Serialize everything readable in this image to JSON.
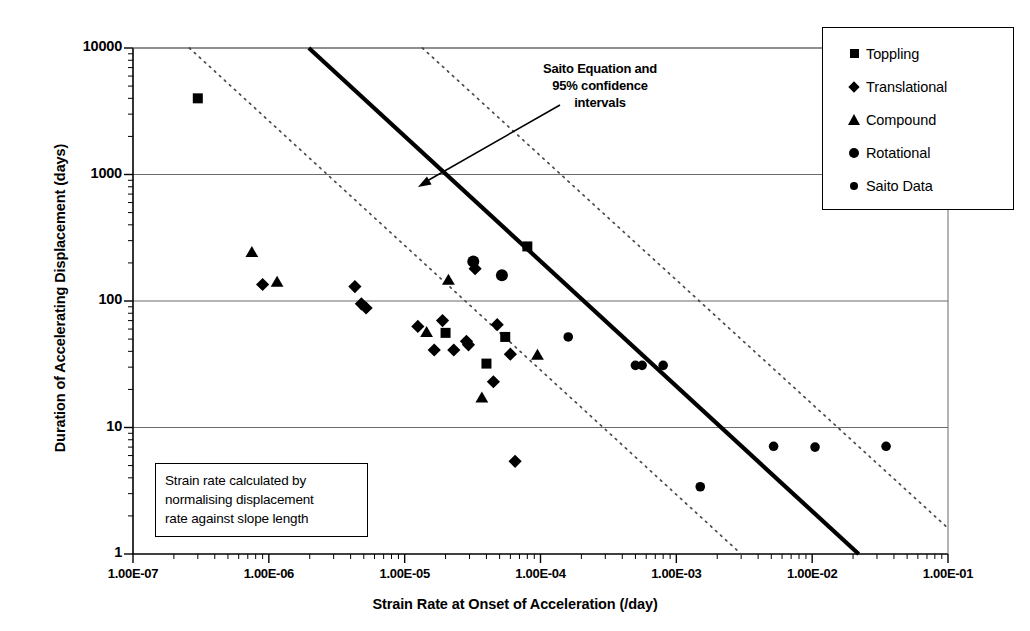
{
  "chart_data": {
    "type": "scatter",
    "title": "",
    "xlabel": "Strain Rate at Onset of Acceleration (/day)",
    "ylabel": "Duration of Accelerating Displacement (days)",
    "xscale": "log",
    "yscale": "log",
    "xlim": [
      1e-07,
      0.1
    ],
    "ylim": [
      1,
      10000
    ],
    "xticklabels": [
      "1.00E-07",
      "1.00E-06",
      "1.00E-05",
      "1.00E-04",
      "1.00E-03",
      "1.00E-02",
      "1.00E-01"
    ],
    "xtickvalues": [
      1e-07,
      1e-06,
      1e-05,
      0.0001,
      0.001,
      0.01,
      0.1
    ],
    "yticklabels": [
      "1",
      "10",
      "100",
      "1000",
      "10000"
    ],
    "ytickvalues": [
      1,
      10,
      100,
      1000,
      10000
    ],
    "grid": "horizontal-major-only",
    "legend_position": "top-right-outside",
    "series": [
      {
        "name": "Toppling",
        "marker": "square",
        "points": [
          [
            3e-07,
            4000
          ],
          [
            2e-05,
            56
          ],
          [
            4e-05,
            32
          ],
          [
            5.5e-05,
            52
          ],
          [
            8e-05,
            270
          ]
        ]
      },
      {
        "name": "Translational",
        "marker": "diamond",
        "points": [
          [
            9e-07,
            135
          ],
          [
            4.3e-06,
            130
          ],
          [
            4.8e-06,
            95
          ],
          [
            5.2e-06,
            88
          ],
          [
            1.25e-05,
            63
          ],
          [
            1.65e-05,
            41
          ],
          [
            1.9e-05,
            70
          ],
          [
            2.3e-05,
            41
          ],
          [
            2.85e-05,
            48
          ],
          [
            2.95e-05,
            45
          ],
          [
            3.3e-05,
            180
          ],
          [
            4.5e-05,
            23
          ],
          [
            4.8e-05,
            65
          ],
          [
            6e-05,
            38
          ],
          [
            6.5e-05,
            5.4
          ]
        ]
      },
      {
        "name": "Compound",
        "marker": "triangle",
        "points": [
          [
            7.5e-07,
            240
          ],
          [
            1.15e-06,
            140
          ],
          [
            1.45e-05,
            56
          ],
          [
            2.1e-05,
            145
          ],
          [
            3.7e-05,
            17
          ],
          [
            9.5e-05,
            37
          ]
        ]
      },
      {
        "name": "Rotational",
        "marker": "circle",
        "points": [
          [
            3.2e-05,
            205
          ],
          [
            5.2e-05,
            160
          ]
        ]
      },
      {
        "name": "Saito Data",
        "marker": "circle-small",
        "points": [
          [
            0.00016,
            52
          ],
          [
            0.0005,
            31
          ],
          [
            0.00056,
            31
          ],
          [
            0.0008,
            31
          ],
          [
            0.0015,
            3.4
          ],
          [
            0.0052,
            7.1
          ],
          [
            0.0105,
            7.0
          ],
          [
            0.035,
            7.1
          ]
        ]
      }
    ],
    "fit_lines": [
      {
        "name": "Saito Equation",
        "style": "solid-thick",
        "x_start": 1.97e-06,
        "y_start": 10000,
        "x_end": 0.022,
        "y_end": 1
      },
      {
        "name": "95% confidence interval lower",
        "style": "dotted",
        "x_start": 2.6e-07,
        "y_start": 10000,
        "x_end": 0.003,
        "y_end": 1
      },
      {
        "name": "95% confidence interval upper",
        "style": "dotted",
        "x_start": 1.35e-05,
        "y_start": 10000,
        "x_end": 0.1,
        "y_end": 1.6
      }
    ],
    "annotations": [
      {
        "name": "saito-equation-callout",
        "text": "Saito Equation and 95% confidence intervals",
        "lines": [
          "Saito Equation and",
          "95% confidence",
          "intervals"
        ],
        "arrow_from": [
          560,
          105
        ],
        "arrow_to": [
          418,
          187
        ]
      },
      {
        "name": "method-note",
        "lines": [
          "Strain rate calculated by",
          "normalising displacement",
          "rate against slope length"
        ]
      }
    ]
  },
  "axes": {
    "x_title": "Strain Rate at Onset of Acceleration (/day)",
    "y_title": "Duration of Accelerating Displacement (days)",
    "x_ticks": [
      "1.00E-07",
      "1.00E-06",
      "1.00E-05",
      "1.00E-04",
      "1.00E-03",
      "1.00E-02",
      "1.00E-01"
    ],
    "y_ticks": [
      "10000",
      "1000",
      "100",
      "10",
      "1"
    ]
  },
  "legend": {
    "items": [
      {
        "label": "Toppling",
        "marker": "square"
      },
      {
        "label": "Translational",
        "marker": "diamond"
      },
      {
        "label": "Compound",
        "marker": "triangle"
      },
      {
        "label": "Rotational",
        "marker": "circle"
      },
      {
        "label": "Saito Data",
        "marker": "circle-small"
      }
    ]
  },
  "annotation": {
    "line1": "Saito Equation and",
    "line2": "95% confidence",
    "line3": "intervals"
  },
  "note_box": {
    "line1": "Strain rate calculated by",
    "line2": "normalising displacement",
    "line3": "rate against slope length"
  },
  "colors": {
    "marker": "#000000",
    "axis": "#000000",
    "gridline": "#6b6b6b",
    "fit_line": "#000000",
    "ci_line": "#4a4a4a",
    "background": "#ffffff"
  }
}
